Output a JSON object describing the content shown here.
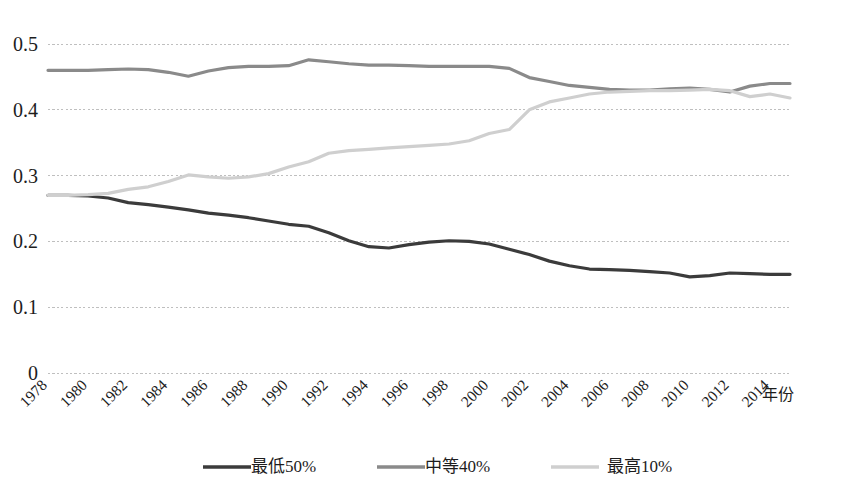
{
  "chart_data": {
    "type": "line",
    "title": "",
    "xlabel": "年份",
    "ylabel": "",
    "xlim": [
      1978,
      2015
    ],
    "ylim": [
      0,
      0.5
    ],
    "grid": true,
    "grid_color": "#b8b8b8",
    "legend_position": "bottom",
    "x": [
      1978,
      1979,
      1980,
      1981,
      1982,
      1983,
      1984,
      1985,
      1986,
      1987,
      1988,
      1989,
      1990,
      1991,
      1992,
      1993,
      1994,
      1995,
      1996,
      1997,
      1998,
      1999,
      2000,
      2001,
      2002,
      2003,
      2004,
      2005,
      2006,
      2007,
      2008,
      2009,
      2010,
      2011,
      2012,
      2013,
      2014,
      2015
    ],
    "x_tick_labels": [
      "1978",
      "1980",
      "1982",
      "1984",
      "1986",
      "1988",
      "1990",
      "1992",
      "1994",
      "1996",
      "1998",
      "2000",
      "2002",
      "2004",
      "2006",
      "2008",
      "2010",
      "2012",
      "2014"
    ],
    "y_tick_labels": [
      "0",
      "0.1",
      "0.2",
      "0.3",
      "0.4",
      "0.5"
    ],
    "y_ticks": [
      0,
      0.1,
      0.2,
      0.3,
      0.4,
      0.5
    ],
    "series": [
      {
        "name": "最低50%",
        "color": "#3b3b3b",
        "width": 3.2,
        "values": [
          0.27,
          0.27,
          0.269,
          0.266,
          0.259,
          0.256,
          0.252,
          0.248,
          0.243,
          0.24,
          0.236,
          0.231,
          0.226,
          0.223,
          0.213,
          0.201,
          0.192,
          0.19,
          0.195,
          0.199,
          0.201,
          0.2,
          0.196,
          0.188,
          0.18,
          0.17,
          0.163,
          0.158,
          0.157,
          0.156,
          0.154,
          0.152,
          0.146,
          0.148,
          0.152,
          0.151,
          0.15,
          0.15
        ]
      },
      {
        "name": "中等40%",
        "color": "#8a8a8a",
        "width": 3.2,
        "values": [
          0.46,
          0.46,
          0.46,
          0.461,
          0.462,
          0.461,
          0.457,
          0.451,
          0.459,
          0.464,
          0.466,
          0.466,
          0.467,
          0.476,
          0.473,
          0.47,
          0.468,
          0.468,
          0.467,
          0.466,
          0.466,
          0.466,
          0.466,
          0.463,
          0.449,
          0.443,
          0.437,
          0.434,
          0.431,
          0.43,
          0.43,
          0.432,
          0.433,
          0.431,
          0.427,
          0.436,
          0.44,
          0.44
        ]
      },
      {
        "name": "最高10%",
        "color": "#cfcfcf",
        "width": 3.2,
        "values": [
          0.27,
          0.27,
          0.271,
          0.273,
          0.279,
          0.283,
          0.291,
          0.301,
          0.298,
          0.296,
          0.298,
          0.303,
          0.313,
          0.321,
          0.334,
          0.338,
          0.34,
          0.342,
          0.344,
          0.346,
          0.348,
          0.353,
          0.364,
          0.37,
          0.4,
          0.412,
          0.418,
          0.424,
          0.427,
          0.428,
          0.429,
          0.429,
          0.43,
          0.431,
          0.429,
          0.42,
          0.424,
          0.418
        ]
      }
    ]
  },
  "legend": {
    "entries": [
      {
        "label": "最低50%",
        "color": "#3b3b3b"
      },
      {
        "label": "中等40%",
        "color": "#8a8a8a"
      },
      {
        "label": "最高10%",
        "color": "#cfcfcf"
      }
    ]
  }
}
